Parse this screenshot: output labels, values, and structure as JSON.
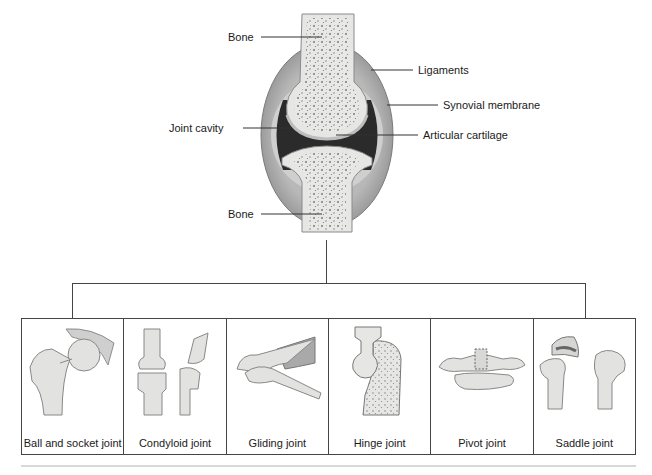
{
  "diagram": {
    "title_labels": {
      "bone_top": "Bone",
      "ligaments": "Ligaments",
      "synovial_membrane": "Synovial membrane",
      "joint_cavity": "Joint cavity",
      "articular_cartilage": "Articular cartilage",
      "bone_bottom": "Bone"
    },
    "joint_types": [
      {
        "label": "Ball and socket joint"
      },
      {
        "label": "Condyloid joint"
      },
      {
        "label": "Gliding joint"
      },
      {
        "label": "Hinge joint"
      },
      {
        "label": "Pivot joint"
      },
      {
        "label": "Saddle joint"
      }
    ],
    "colors": {
      "bone": "#e6e6e4",
      "marrow_dots": "#7a7a7a",
      "capsule": "#a9a9a9",
      "cavity": "#2b2b2b",
      "line": "#333333"
    }
  }
}
